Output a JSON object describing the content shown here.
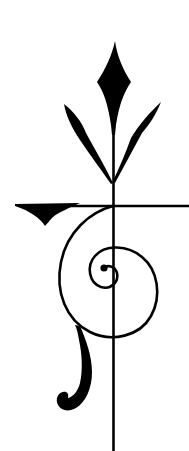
{
  "image": {
    "description": "Black decorative emblem on white: a vertical staff topped with a diamond finial flanked by two leaves, crossed by a horizontal bar with a wedge on its left end, and a spiral that curls inward with a swooping tail ending in a small curl.",
    "width": 189,
    "height": 451
  },
  "colors": {
    "background": "#ffffff",
    "ink": "#000000"
  },
  "elements": {
    "finial": "diamond-finial",
    "leaves": [
      "left-leaf",
      "right-leaf"
    ],
    "staff": "vertical-staff",
    "crossbar": "horizontal-crossbar",
    "wedge": "crossbar-wedge",
    "spiral": "spiral-curl",
    "tail": "tail-swoosh"
  }
}
